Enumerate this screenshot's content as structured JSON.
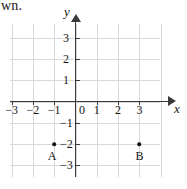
{
  "caption": {
    "fragment_text": "wn."
  },
  "chart_data": {
    "type": "scatter",
    "title": "",
    "xlabel": "x",
    "ylabel": "y",
    "xlim": [
      -3.5,
      4.0
    ],
    "ylim": [
      -3.6,
      3.6
    ],
    "grid": true,
    "legend": null,
    "xticks": [
      -3,
      -2,
      -1,
      1,
      2,
      3
    ],
    "yticks": [
      3,
      2,
      1,
      -1,
      -2,
      -3
    ],
    "xtick_labels": [
      "−3",
      "−2",
      "−1",
      "1",
      "2",
      "3"
    ],
    "ytick_labels": [
      "3",
      "2",
      "1",
      "−1",
      "−2",
      "−3"
    ],
    "origin_label": "0",
    "points": [
      {
        "name": "A",
        "x": -1,
        "y": -2,
        "label": "A"
      },
      {
        "name": "B",
        "x": 3,
        "y": -2,
        "label": "B"
      }
    ]
  },
  "colors": {
    "grid": "#d9d9d9",
    "axis": "#3a3a3a",
    "point": "#111111",
    "text": "#151515",
    "background": "#ffffff"
  }
}
